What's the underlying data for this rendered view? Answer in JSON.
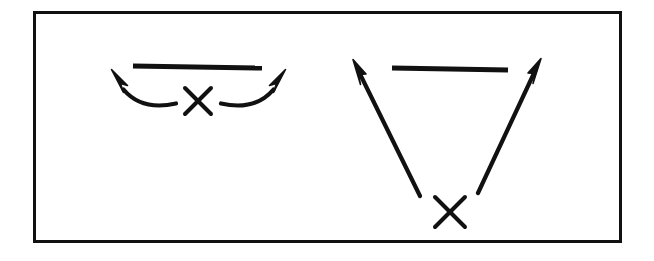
{
  "figure": {
    "title": "Two-panel play diagram",
    "background_color": "#ffffff",
    "ink_color": "#111111",
    "border": {
      "name": "outer-frame",
      "x": 33,
      "y": 11,
      "width": 589,
      "height": 232,
      "stroke_width": 3,
      "color": "#111111"
    }
  },
  "chart_data": {
    "type": "diagram",
    "title": "Two-panel play diagram",
    "panels": [
      {
        "id": "left-panel",
        "label": "Curved release panel",
        "elements": [
          {
            "kind": "bar",
            "name": "line-of-scrimmage",
            "x1": 133,
            "y1": 66,
            "x2": 262,
            "y2": 68,
            "stroke_width": 5
          },
          {
            "kind": "x-marker",
            "name": "player-x",
            "cx": 198,
            "cy": 101,
            "size": 26,
            "stroke_width": 4
          },
          {
            "kind": "curved-arrow",
            "name": "left-curved-route",
            "path": "M 175 103 C 155 107 136 104 120 88",
            "tip_x": 111,
            "tip_y": 70,
            "stroke_width": 4,
            "direction": "up-left"
          },
          {
            "kind": "curved-arrow",
            "name": "right-curved-route",
            "path": "M 222 103 C 242 107 261 104 277 88",
            "tip_x": 286,
            "tip_y": 70,
            "stroke_width": 4,
            "direction": "up-right"
          }
        ]
      },
      {
        "id": "right-panel",
        "label": "Straight release panel",
        "elements": [
          {
            "kind": "bar",
            "name": "line-of-scrimmage",
            "x1": 392,
            "y1": 68,
            "x2": 508,
            "y2": 70,
            "stroke_width": 5
          },
          {
            "kind": "x-marker",
            "name": "player-x",
            "cx": 450,
            "cy": 212,
            "size": 30,
            "stroke_width": 4
          },
          {
            "kind": "straight-arrow",
            "name": "left-straight-route",
            "x1": 420,
            "y1": 196,
            "x2": 354,
            "y2": 62,
            "stroke_width": 4,
            "direction": "up-left"
          },
          {
            "kind": "straight-arrow",
            "name": "right-straight-route",
            "x1": 478,
            "y1": 193,
            "x2": 540,
            "y2": 61,
            "stroke_width": 4,
            "direction": "up-right"
          }
        ]
      }
    ],
    "xlabel": "",
    "ylabel": "",
    "grid": false,
    "legend": null
  }
}
